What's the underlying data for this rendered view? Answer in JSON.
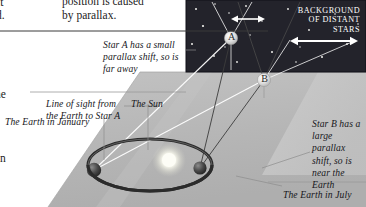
{
  "figure": {
    "type": "stellar-parallax-diagram",
    "topic": "Measuring distance to stars by parallax"
  },
  "page_text": {
    "line_a": "position is caused",
    "line_b": "by parallax.",
    "edge_fragment_1": "it",
    "edge_fragment_2": "d.",
    "edge_fragment_3": "ne",
    "edge_fragment_4": "an"
  },
  "annotations": {
    "star_a_note": "Star A has a small parallax shift, so is far away",
    "line_of_sight_note": "Line of sight from the Earth to Star A",
    "sun_label": "The Sun",
    "earth_january_label": "The Earth in January",
    "star_b_note": "Star B has a large parallax shift, so is near the Earth",
    "earth_july_label": "The Earth in July"
  },
  "sky_panel": {
    "caption_lines": [
      "Background",
      "of distant",
      "stars"
    ],
    "background_color": "#23232b",
    "star_color": "#f2f2ee"
  },
  "stars": {
    "star_a": {
      "label": "A",
      "x": 231,
      "y": 38,
      "parallax": "small",
      "distance": "far"
    },
    "star_b": {
      "label": "B",
      "x": 264,
      "y": 80,
      "parallax": "large",
      "distance": "near"
    }
  },
  "shift_arrows": {
    "star_a_arrow": {
      "label": "small parallax shift",
      "x1": 232,
      "y1": 19,
      "x2": 264,
      "y2": 19,
      "length": 32
    },
    "star_b_arrow": {
      "label": "large parallax shift",
      "x1": 292,
      "y1": 41,
      "x2": 356,
      "y2": 41,
      "length": 64
    }
  },
  "orbit": {
    "sun": {
      "label": "The Sun",
      "x": 169,
      "y": 160,
      "color": "#fbfbf4"
    },
    "earth_january": {
      "label": "The Earth in January",
      "x": 94,
      "y": 170
    },
    "earth_july": {
      "label": "The Earth in July",
      "x": 200,
      "y": 168
    },
    "orbit_color": "#2b2b2b"
  },
  "colors": {
    "ground_plane": "#b9b9b9",
    "ground_plane_light": "#c9c9c9",
    "sight_line": "#ffffff",
    "leader_line": "#8d8d8d",
    "rule": "#3a3a3a",
    "text": "#17171b"
  },
  "rules": {
    "top_rule_y": 31,
    "mid_rule_y": 92,
    "bottom_rule_y": 182
  }
}
